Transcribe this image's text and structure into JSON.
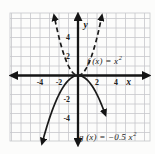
{
  "chart_data": {
    "type": "line",
    "title": "",
    "xlabel": "x",
    "ylabel": "y",
    "x_ticks": [
      -4,
      -2,
      2,
      4
    ],
    "y_ticks": [
      4,
      2,
      -2,
      -4
    ],
    "xlim": [
      -7.2,
      7.6
    ],
    "ylim": [
      -6.9,
      6.6
    ],
    "grid": true,
    "series": [
      {
        "name": "f",
        "equation": "f(x) = x^2",
        "label_text": "f (x) = x",
        "label_sup": "2",
        "coefficient": 1,
        "style": "dashed",
        "x_range": [
          -2.42,
          2.42
        ],
        "vertex": [
          0,
          0
        ],
        "opens": "up"
      },
      {
        "name": "g",
        "equation": "g(x) = -0.5x^2",
        "label_text": "g (x) = −0.5 x",
        "label_sup": "2",
        "coefficient": -0.5,
        "style": "solid",
        "x_range": [
          -3.66,
          2.72
        ],
        "vertex": [
          0,
          0
        ],
        "opens": "down"
      }
    ],
    "colors": {
      "grid": "#c6c7cb",
      "axis": "#151515",
      "curve": "#1a1a1a",
      "text": "#222222",
      "background": "#fcfcfb"
    }
  }
}
